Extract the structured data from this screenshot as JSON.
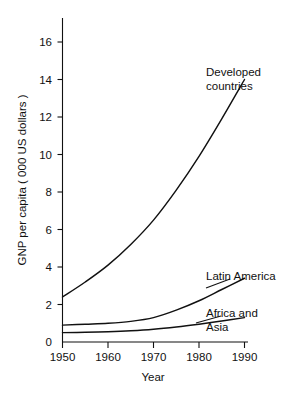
{
  "chart_data": {
    "type": "line",
    "title": "",
    "xlabel": "Year",
    "ylabel": "GNP per capita ( 000 US dollars )",
    "xlim": [
      1950,
      1990
    ],
    "ylim": [
      0,
      16
    ],
    "xticks": [
      "1950",
      "1960",
      "1970",
      "1980",
      "1990"
    ],
    "yticks": [
      "0",
      "2",
      "4",
      "6",
      "8",
      "10",
      "12",
      "14",
      "16"
    ],
    "grid": false,
    "legend_position": "inline-annotations",
    "x": [
      1950,
      1955,
      1960,
      1965,
      1970,
      1975,
      1980,
      1985,
      1990
    ],
    "series": [
      {
        "name": "Developed countries",
        "label_line1": "Developed",
        "label_line2": "countries",
        "values": [
          2.4,
          3.2,
          4.1,
          5.2,
          6.5,
          8.1,
          9.9,
          11.9,
          14.0
        ]
      },
      {
        "name": "Latin America",
        "label_line1": "Latin America",
        "label_line2": "",
        "values": [
          0.9,
          0.95,
          1.0,
          1.1,
          1.3,
          1.7,
          2.2,
          2.8,
          3.4
        ]
      },
      {
        "name": "Africa and Asia",
        "label_line1": "Africa and",
        "label_line2": "Asia",
        "values": [
          0.5,
          0.52,
          0.55,
          0.6,
          0.68,
          0.8,
          0.95,
          1.12,
          1.3
        ]
      }
    ],
    "colors": {
      "background": "#ffffff",
      "ink": "#111111",
      "curve": "#111111"
    }
  }
}
